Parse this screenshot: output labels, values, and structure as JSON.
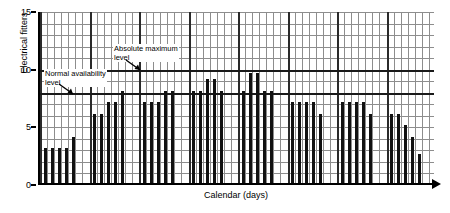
{
  "chart_data": {
    "type": "bar",
    "title": "",
    "xlabel": "Calendar (days)",
    "ylabel": "Electrical fitters",
    "ylim": [
      0,
      15
    ],
    "ytick_labels": [
      "0",
      "5",
      "10",
      "15"
    ],
    "ytick_values": [
      0,
      5,
      10,
      15
    ],
    "grid": true,
    "grid_minor_step": 1,
    "legend": "none",
    "x": [
      1,
      2,
      3,
      4,
      5,
      8,
      9,
      10,
      11,
      12,
      15,
      16,
      17,
      18,
      19,
      22,
      23,
      24,
      25,
      26,
      29,
      30,
      31,
      32,
      33,
      36,
      37,
      38,
      39,
      40,
      43,
      44,
      45,
      46,
      47,
      50,
      51,
      52,
      53,
      54
    ],
    "values": [
      3,
      3,
      3,
      3,
      4,
      6,
      6,
      7,
      7,
      8,
      7,
      7,
      7,
      8,
      8,
      8,
      8,
      9,
      9,
      8,
      8,
      9.5,
      9.5,
      8,
      8,
      7,
      7,
      7,
      7,
      6,
      7,
      7,
      7,
      7,
      6,
      6,
      6,
      5,
      4,
      2.5
    ],
    "bar_groups": [
      {
        "label": "week-1",
        "values": [
          3,
          3,
          3,
          3,
          4
        ]
      },
      {
        "label": "week-2",
        "values": [
          6,
          6,
          7,
          7,
          8
        ]
      },
      {
        "label": "week-3",
        "values": [
          7,
          7,
          7,
          8,
          8
        ]
      },
      {
        "label": "week-4",
        "values": [
          8,
          8,
          9,
          9,
          8
        ]
      },
      {
        "label": "week-5",
        "values": [
          8,
          9.5,
          9.5,
          8,
          8
        ]
      },
      {
        "label": "week-6",
        "values": [
          7,
          7,
          7,
          7,
          6
        ]
      },
      {
        "label": "week-7",
        "values": [
          7,
          7,
          7,
          7,
          6
        ]
      },
      {
        "label": "week-8",
        "values": [
          6,
          6,
          5,
          4,
          2.5
        ]
      }
    ],
    "reference_lines": [
      {
        "name": "normal-availability-level",
        "value": 8,
        "label_line1": "Normal availability",
        "label_line2": "level"
      },
      {
        "name": "absolute-maximum-level",
        "value": 10,
        "label_line1": "Absolute maximum",
        "label_line2": "level"
      }
    ]
  },
  "axes": {
    "y_title": "Electrical fitters",
    "x_title": "Calendar (days)"
  },
  "annotations": {
    "normal": {
      "line1": "Normal availability",
      "line2": "level"
    },
    "absolute": {
      "line1": "Absolute maximum",
      "line2": "level"
    }
  }
}
